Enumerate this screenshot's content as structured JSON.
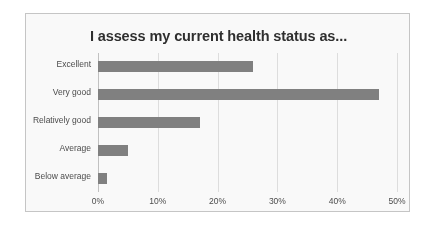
{
  "figure": {
    "background_color": "#ffffff",
    "frame_color": "#c9c9c9"
  },
  "chart_data": {
    "type": "bar",
    "orientation": "horizontal",
    "title": "I assess my current health status as...",
    "xlabel": "",
    "ylabel": "",
    "categories": [
      "Excellent",
      "Very good",
      "Relatively good",
      "Average",
      "Below average"
    ],
    "values": [
      26,
      47,
      17,
      5,
      1.5
    ],
    "value_format": "percent",
    "xlim": [
      0,
      50
    ],
    "xticks": [
      0,
      10,
      20,
      30,
      40,
      50
    ],
    "xtick_labels": [
      "0%",
      "10%",
      "20%",
      "30%",
      "40%",
      "50%"
    ],
    "grid": "vertical",
    "legend": "none",
    "series": [
      {
        "name": "Share of respondents",
        "color": "#808080",
        "values": [
          26,
          47,
          17,
          5,
          1.5
        ]
      }
    ],
    "bar_color": "#808080"
  }
}
